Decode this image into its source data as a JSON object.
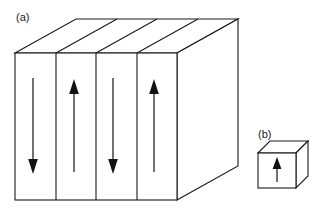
{
  "figure": {
    "type": "line-diagram",
    "background_color": "#ffffff",
    "stroke_color": "#1a1a1a",
    "canvas": {
      "width": 325,
      "height": 213
    }
  },
  "panels": [
    {
      "id": "a",
      "label": "(a)",
      "label_x": 16,
      "label_y": 21,
      "shape": "multi-domain-slab",
      "front_face": {
        "x": 15,
        "y": 53,
        "width": 162,
        "height": 147
      },
      "depth_dx": 61,
      "depth_dy": -34,
      "domain_count": 4,
      "domain_boundaries_x": [
        15,
        56,
        96,
        137,
        177
      ],
      "arrows": [
        {
          "index": 1,
          "direction": "down",
          "x": 33,
          "y_start": 78,
          "y_end": 172,
          "label": "domain-arrow-down-1"
        },
        {
          "index": 2,
          "direction": "up",
          "x": 74,
          "y_start": 172,
          "y_end": 80,
          "label": "domain-arrow-up-2"
        },
        {
          "index": 3,
          "direction": "down",
          "x": 113,
          "y_start": 78,
          "y_end": 172,
          "label": "domain-arrow-down-3"
        },
        {
          "index": 4,
          "direction": "up",
          "x": 154,
          "y_start": 172,
          "y_end": 80,
          "label": "domain-arrow-up-4"
        }
      ]
    },
    {
      "id": "b",
      "label": "(b)",
      "label_x": 258,
      "label_y": 138,
      "shape": "single-domain-cube",
      "front_face": {
        "x": 258,
        "y": 153,
        "width": 38,
        "height": 35
      },
      "depth_dx": 12,
      "depth_dy": -12,
      "domain_count": 1,
      "arrows": [
        {
          "index": 1,
          "direction": "up",
          "x": 277,
          "y_start": 182,
          "y_end": 159,
          "label": "cube-arrow-up-1"
        }
      ]
    }
  ],
  "colors": {
    "stroke": "#1a1a1a",
    "fill": "#ffffff",
    "arrow": "#111111"
  }
}
